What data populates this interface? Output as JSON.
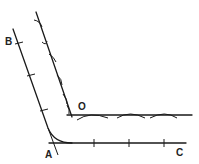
{
  "diagram": {
    "labels": {
      "B": "B",
      "O": "O",
      "A": "A",
      "C": "C"
    },
    "colors": {
      "stroke": "#1a1a1a",
      "background": "#ffffff"
    }
  }
}
